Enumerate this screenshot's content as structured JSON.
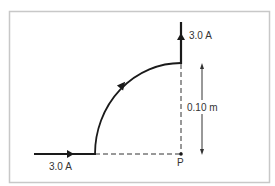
{
  "diagram": {
    "labels": {
      "current_in": "3.0 A",
      "current_out": "3.0 A",
      "radius": "0.10 m",
      "point": "P"
    },
    "colors": {
      "wire": "#1a1a1a",
      "dashed": "#333333",
      "frame": "#c8c8c8",
      "text": "#333333"
    },
    "elements": [
      {
        "name": "incoming-wire",
        "description": "horizontal straight wire carrying current to the right"
      },
      {
        "name": "quarter-arc",
        "description": "quarter-circle arc of radius 0.10 m centred at P, current flows counter-clockwise"
      },
      {
        "name": "outgoing-wire",
        "description": "vertical straight wire carrying current upward"
      },
      {
        "name": "point-P",
        "description": "centre of the arc"
      },
      {
        "name": "radius-dimension",
        "description": "double-headed arrow indicating radius 0.10 m"
      }
    ]
  }
}
